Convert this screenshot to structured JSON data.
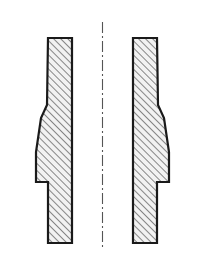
{
  "drawing": {
    "title": "Sectioned symmetric part profile",
    "background_color": "#ffffff",
    "outline_color": "#1a1a1a",
    "hatch_color": "#2b2b2b",
    "fill_color": "#f2f2f2",
    "centerline_color": "#555555",
    "outline_width": 2.2,
    "hatch_angle_deg": 45,
    "hatch_spacing_px": 5,
    "hatch_width": 1.1,
    "canvas": {
      "width": 206,
      "height": 267
    },
    "centerline": {
      "label": "axis-of-symmetry",
      "x": 102.5,
      "y_top": 22,
      "y_bottom": 248,
      "dash_pattern": "11 3 2 3",
      "stroke_width": 1.1
    },
    "left_profile": {
      "label": "left-half-section",
      "points": "48,38 72,38 72,243 48,243 48,182 36,182 36,152 41,118 47,105"
    },
    "right_profile": {
      "label": "right-half-section",
      "points": "157,38 133,38 133,243 157,243 157,182 169,182 169,152 164,118 158,105"
    },
    "notes": {
      "view_type": "half-section",
      "symmetry": "mirrored about vertical axis",
      "visible_text": ""
    }
  }
}
